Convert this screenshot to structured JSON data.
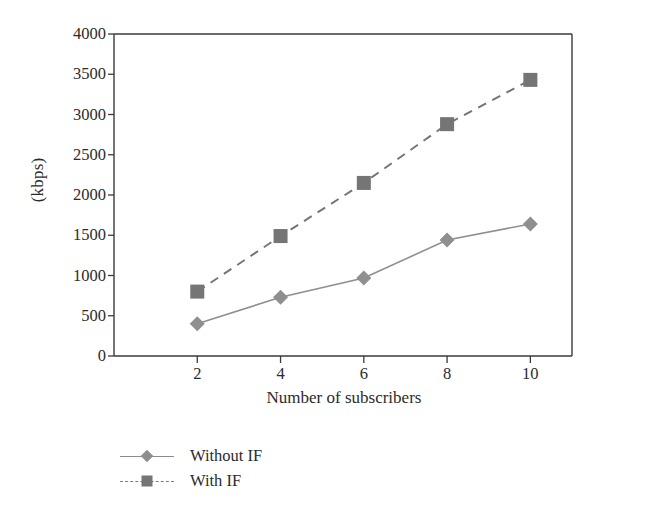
{
  "chart_data": {
    "type": "line",
    "title": "",
    "xlabel": "Number of subscribers",
    "ylabel": "(kbps)",
    "x": [
      2,
      4,
      6,
      8,
      10
    ],
    "xlim": [
      0,
      11
    ],
    "ylim": [
      0,
      4000
    ],
    "xticks": [
      2,
      4,
      6,
      8,
      10
    ],
    "yticks": [
      0,
      500,
      1000,
      1500,
      2000,
      2500,
      3000,
      3500,
      4000
    ],
    "xtick_labels": [
      "2",
      "4",
      "6",
      "8",
      "10"
    ],
    "ytick_labels": [
      "0",
      "500",
      "1000",
      "1500",
      "2000",
      "2500",
      "3000",
      "3500",
      "4000"
    ],
    "grid": false,
    "legend_position": "below-left",
    "series": [
      {
        "name": "Without IF",
        "values": [
          400,
          730,
          970,
          1440,
          1640
        ],
        "marker": "diamond",
        "line_style": "solid",
        "color": "#8f8f8f"
      },
      {
        "name": "With IF",
        "values": [
          800,
          1490,
          2150,
          2880,
          3430
        ],
        "marker": "square",
        "line_style": "dashed",
        "color": "#757575"
      }
    ]
  },
  "legend": {
    "items": [
      {
        "label": "Without IF"
      },
      {
        "label": "With IF"
      }
    ]
  },
  "colors": {
    "axis": "#3a3a3a",
    "series_without_if": "#8f8f8f",
    "series_with_if": "#757575",
    "background": "#ffffff",
    "text": "#2b2b2b"
  }
}
